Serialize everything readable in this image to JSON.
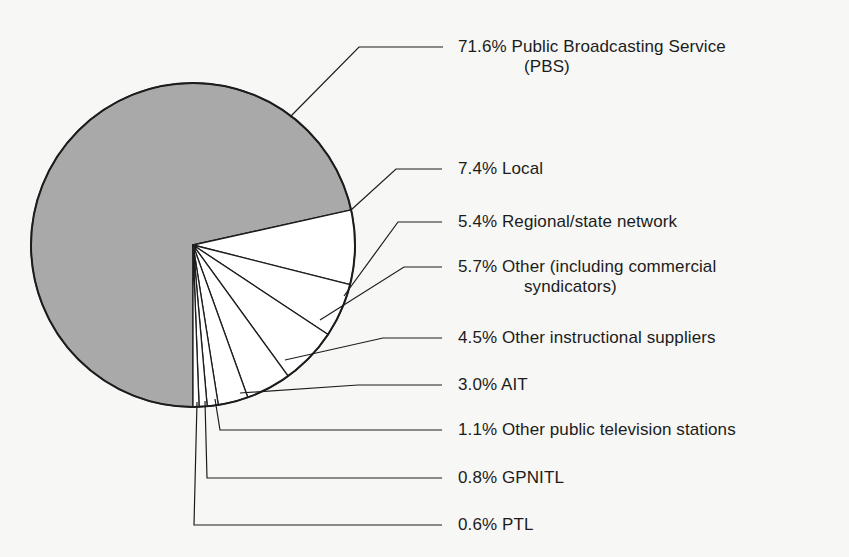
{
  "chart_data": {
    "type": "pie",
    "title": "",
    "center": [
      193,
      245
    ],
    "radius": 162,
    "start_angle_deg": 270,
    "colors": {
      "highlight": "#a9a9a9",
      "other": "#ffffff",
      "stroke": "#1c1c1c",
      "background": "#f7f7f5"
    },
    "slices": [
      {
        "label": "Public Broadcasting Service (PBS)",
        "value": 71.6,
        "text": "71.6% Public Broadcasting Service",
        "text2": "(PBS)",
        "fill": "#a9a9a9"
      },
      {
        "label": "Local",
        "value": 7.4,
        "text": "7.4% Local",
        "fill": "#ffffff"
      },
      {
        "label": "Regional/state network",
        "value": 5.4,
        "text": "5.4% Regional/state network",
        "fill": "#ffffff"
      },
      {
        "label": "Other (including commercial syndicators)",
        "value": 5.7,
        "text": "5.7% Other (including commercial",
        "text2": "syndicators)",
        "fill": "#ffffff"
      },
      {
        "label": "Other instructional suppliers",
        "value": 4.5,
        "text": "4.5% Other instructional suppliers",
        "fill": "#ffffff"
      },
      {
        "label": "AIT",
        "value": 3.0,
        "text": "3.0% AIT",
        "fill": "#ffffff"
      },
      {
        "label": "Other public television stations",
        "value": 1.1,
        "text": "1.1% Other public television stations",
        "fill": "#ffffff"
      },
      {
        "label": "GPNITL",
        "value": 0.8,
        "text": "0.8% GPNITL",
        "fill": "#ffffff"
      },
      {
        "label": "PTL",
        "value": 0.6,
        "text": "0.6% PTL",
        "fill": "#ffffff"
      }
    ],
    "leaders": [
      {
        "points": [
          [
            290,
            117
          ],
          [
            359,
            47
          ],
          [
            443,
            47
          ]
        ],
        "label_pos": [
          458,
          37
        ]
      },
      {
        "points": [
          [
            351,
            210
          ],
          [
            396,
            169
          ],
          [
            442,
            169
          ]
        ],
        "label_pos": [
          458,
          159
        ]
      },
      {
        "points": [
          [
            344,
            296
          ],
          [
            398,
            222
          ],
          [
            442,
            222
          ]
        ],
        "label_pos": [
          458,
          212
        ]
      },
      {
        "points": [
          [
            320,
            320
          ],
          [
            404,
            267
          ],
          [
            442,
            267
          ]
        ],
        "label_pos": [
          458,
          257
        ]
      },
      {
        "points": [
          [
            285,
            360
          ],
          [
            383,
            338
          ],
          [
            442,
            338
          ]
        ],
        "label_pos": [
          458,
          328
        ]
      },
      {
        "points": [
          [
            240,
            393
          ],
          [
            358,
            385
          ],
          [
            442,
            385
          ]
        ],
        "label_pos": [
          458,
          375
        ]
      },
      {
        "points": [
          [
            215,
            399
          ],
          [
            220,
            430
          ],
          [
            442,
            430
          ]
        ],
        "label_pos": [
          458,
          420
        ]
      },
      {
        "points": [
          [
            205,
            401
          ],
          [
            207,
            478
          ],
          [
            442,
            478
          ]
        ],
        "label_pos": [
          458,
          468
        ]
      },
      {
        "points": [
          [
            197,
            402
          ],
          [
            194,
            525
          ],
          [
            442,
            525
          ]
        ],
        "label_pos": [
          458,
          515
        ]
      }
    ]
  }
}
